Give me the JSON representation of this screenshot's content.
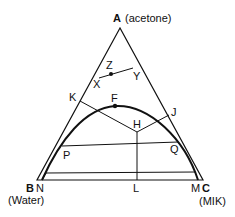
{
  "diagram": {
    "type": "ternary-phase-diagram",
    "vertices": {
      "A": {
        "letter": "A",
        "name": "(acetone)"
      },
      "B": {
        "letter": "B",
        "name": "(Water)"
      },
      "C": {
        "letter": "C",
        "name": "(MIK)"
      }
    },
    "points": {
      "X": "X",
      "Y": "Y",
      "Z": "Z",
      "K": "K",
      "F": "F",
      "H": "H",
      "J": "J",
      "P": "P",
      "Q": "Q",
      "N": "N",
      "L": "L",
      "M": "M"
    },
    "colors": {
      "line": "#111111",
      "background": "#ffffff"
    }
  }
}
